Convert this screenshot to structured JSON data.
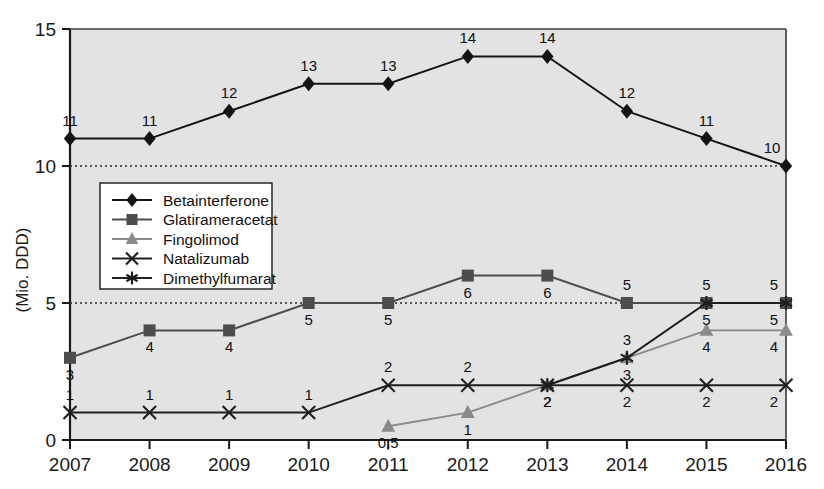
{
  "chart_data": {
    "type": "line",
    "title": "",
    "xlabel": "",
    "ylabel": "(Mio. DDD)",
    "categories": [
      "2007",
      "2008",
      "2009",
      "2010",
      "2011",
      "2012",
      "2013",
      "2014",
      "2015",
      "2016"
    ],
    "x": [
      2007,
      2008,
      2009,
      2010,
      2011,
      2012,
      2013,
      2014,
      2015,
      2016
    ],
    "ylim": [
      0,
      15
    ],
    "yticks": [
      0,
      5,
      10,
      15
    ],
    "ytick_labels": [
      "0",
      "5",
      "10",
      "15"
    ],
    "grid": "dotted horizontal gridlines at 5 and 10",
    "legend_position": "inside upper-left",
    "plot_background": "#e3e3e3",
    "series": [
      {
        "name": "Betainterferone",
        "marker": "diamond",
        "color": "#141414",
        "values": [
          11,
          11,
          12,
          13,
          13,
          14,
          14,
          12,
          11,
          10
        ],
        "labels": [
          "11",
          "11",
          "12",
          "13",
          "13",
          "14",
          "14",
          "12",
          "11",
          "10"
        ]
      },
      {
        "name": "Glatirameracetat",
        "marker": "square",
        "color": "#4d4d4d",
        "values": [
          3,
          4,
          4,
          5,
          5,
          6,
          6,
          5,
          5,
          5
        ],
        "labels": [
          "3",
          "4",
          "4",
          "5",
          "5",
          "6",
          "6",
          "5",
          "5",
          "5"
        ]
      },
      {
        "name": "Fingolimod",
        "marker": "triangle",
        "color": "#8a8a8a",
        "values": [
          null,
          null,
          null,
          null,
          0.5,
          1,
          2,
          3,
          4,
          4
        ],
        "labels": [
          "",
          "",
          "",
          "",
          "0,5",
          "1",
          "2",
          "3",
          "4",
          "4"
        ]
      },
      {
        "name": "Natalizumab",
        "marker": "cross",
        "color": "#1f1f1f",
        "values": [
          1,
          1,
          1,
          1,
          2,
          2,
          2,
          2,
          2,
          2
        ],
        "labels": [
          "1",
          "1",
          "1",
          "1",
          "2",
          "2",
          "2",
          "2",
          "2",
          "2"
        ]
      },
      {
        "name": "Dimethylfumarat",
        "marker": "asterisk",
        "color": "#1f1f1f",
        "values": [
          null,
          null,
          null,
          null,
          null,
          null,
          2,
          3,
          5,
          5
        ],
        "labels": [
          "",
          "",
          "",
          "",
          "",
          "",
          "",
          "3",
          "5",
          "5"
        ]
      }
    ]
  },
  "legend": {
    "items": [
      {
        "label": "Betainterferone"
      },
      {
        "label": "Glatirameracetat"
      },
      {
        "label": "Fingolimod"
      },
      {
        "label": "Natalizumab"
      },
      {
        "label": "Dimethylfumarat"
      }
    ]
  },
  "axes": {
    "y_axis_title": "(Mio. DDD)",
    "y_ticks": [
      "15",
      "10",
      "5",
      "0"
    ],
    "x_ticks": [
      "2007",
      "2008",
      "2009",
      "2010",
      "2011",
      "2012",
      "2013",
      "2014",
      "2015",
      "2016"
    ]
  }
}
